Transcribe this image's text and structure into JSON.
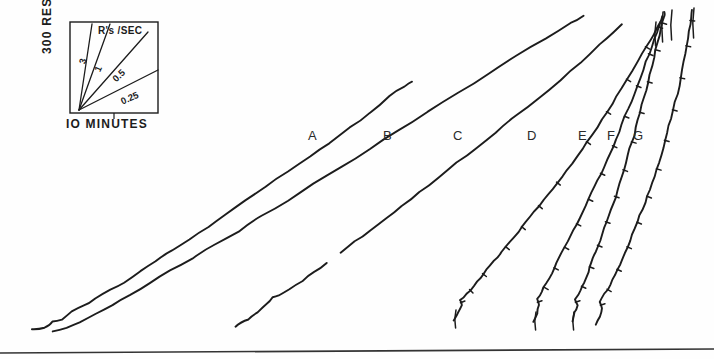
{
  "figure": {
    "background_color": "#fefefe",
    "ink_color": "#1c1c1c",
    "baseline_rule": {
      "name": "bottom-rule",
      "x1": 0,
      "y1": 353,
      "x2": 714,
      "y2": 349
    }
  },
  "legend": {
    "header": "R's /SEC",
    "y_axis_label": "300 RESPONSES",
    "x_axis_label": "IO MINUTES",
    "box": {
      "x": 70,
      "y": 22,
      "width": 88,
      "height": 91
    },
    "origin": {
      "x": 79,
      "y": 110
    },
    "tick_x": 114,
    "rate_lines": [
      {
        "label": "3",
        "end_x": 92,
        "end_y": 24,
        "label_x": 86,
        "label_y": 62,
        "angle": -76
      },
      {
        "label": "1",
        "end_x": 110,
        "end_y": 24,
        "label_x": 101,
        "label_y": 70,
        "angle": -66
      },
      {
        "label": "0.5",
        "end_x": 148,
        "end_y": 32,
        "label_x": 121,
        "label_y": 78,
        "angle": -44
      },
      {
        "label": "0.25",
        "end_x": 158,
        "end_y": 70,
        "label_x": 131,
        "label_y": 101,
        "angle": -24
      }
    ]
  },
  "chart_data": {
    "type": "line",
    "title": "",
    "subtitle": "",
    "xlabel": "IO MINUTES",
    "ylabel": "300 RESPONSES",
    "grid": false,
    "legend_position": "inset-top-left",
    "legend_entries": [
      "3",
      "1",
      "0.5",
      "0.25"
    ],
    "annotations": [
      "R's /SEC"
    ],
    "axis_note": "Cumulative response record; axes are calibration bars only, no numeric tick labels on the main field.",
    "series": [
      {
        "name": "A",
        "label_x": 308,
        "label_y": 128,
        "rate_rps": 0.25,
        "ticks": false,
        "points": [
          [
            32,
            329
          ],
          [
            45,
            328
          ],
          [
            52,
            322
          ],
          [
            62,
            319
          ],
          [
            72,
            311
          ],
          [
            84,
            306
          ],
          [
            96,
            299
          ],
          [
            110,
            290
          ],
          [
            124,
            282
          ],
          [
            140,
            271
          ],
          [
            156,
            261
          ],
          [
            172,
            251
          ],
          [
            190,
            239
          ],
          [
            208,
            227
          ],
          [
            226,
            215
          ],
          [
            246,
            201
          ],
          [
            266,
            187
          ],
          [
            288,
            172
          ],
          [
            310,
            157
          ],
          [
            330,
            143
          ],
          [
            350,
            128
          ],
          [
            370,
            113
          ],
          [
            390,
            96
          ],
          [
            404,
            86
          ],
          [
            412,
            82
          ]
        ]
      },
      {
        "name": "B",
        "label_x": 383,
        "label_y": 128,
        "rate_rps": 0.3,
        "ticks": false,
        "points": [
          [
            52,
            332
          ],
          [
            66,
            328
          ],
          [
            80,
            322
          ],
          [
            96,
            314
          ],
          [
            112,
            305
          ],
          [
            130,
            295
          ],
          [
            150,
            283
          ],
          [
            170,
            271
          ],
          [
            192,
            258
          ],
          [
            214,
            245
          ],
          [
            238,
            231
          ],
          [
            262,
            216
          ],
          [
            288,
            200
          ],
          [
            314,
            184
          ],
          [
            342,
            167
          ],
          [
            370,
            149
          ],
          [
            398,
            131
          ],
          [
            428,
            112
          ],
          [
            458,
            93
          ],
          [
            488,
            74
          ],
          [
            516,
            56
          ],
          [
            546,
            38
          ],
          [
            570,
            23
          ],
          [
            584,
            16
          ]
        ]
      },
      {
        "name": "C",
        "label_x": 453,
        "label_y": 128,
        "rate_rps": 0.4,
        "ticks": false,
        "break_at_index": 9,
        "points": [
          [
            235,
            326
          ],
          [
            248,
            319
          ],
          [
            258,
            312
          ],
          [
            266,
            304
          ],
          [
            272,
            298
          ],
          [
            278,
            295
          ],
          [
            290,
            289
          ],
          [
            302,
            281
          ],
          [
            314,
            272
          ],
          [
            326,
            263
          ],
          [
            340,
            253
          ],
          [
            354,
            242
          ],
          [
            370,
            230
          ],
          [
            386,
            218
          ],
          [
            402,
            206
          ],
          [
            420,
            192
          ],
          [
            438,
            178
          ],
          [
            456,
            163
          ],
          [
            476,
            148
          ],
          [
            496,
            132
          ],
          [
            516,
            116
          ],
          [
            538,
            98
          ],
          [
            560,
            80
          ],
          [
            580,
            63
          ],
          [
            600,
            45
          ],
          [
            614,
            32
          ],
          [
            622,
            24
          ]
        ]
      },
      {
        "name": "D",
        "label_x": 527,
        "label_y": 128,
        "rate_rps": 0.55,
        "ticks": true,
        "tick_count": 11,
        "points": [
          [
            454,
            320
          ],
          [
            459,
            312
          ],
          [
            462,
            305
          ],
          [
            460,
            300
          ],
          [
            466,
            294
          ],
          [
            474,
            286
          ],
          [
            480,
            278
          ],
          [
            486,
            270
          ],
          [
            494,
            261
          ],
          [
            502,
            252
          ],
          [
            510,
            242
          ],
          [
            518,
            232
          ],
          [
            526,
            222
          ],
          [
            534,
            212
          ],
          [
            544,
            200
          ],
          [
            552,
            189
          ],
          [
            562,
            176
          ],
          [
            572,
            163
          ],
          [
            582,
            149
          ],
          [
            592,
            135
          ],
          [
            602,
            120
          ],
          [
            612,
            104
          ],
          [
            622,
            88
          ],
          [
            632,
            71
          ],
          [
            642,
            54
          ],
          [
            650,
            40
          ],
          [
            656,
            29
          ],
          [
            660,
            22
          ]
        ]
      },
      {
        "name": "E",
        "label_x": 578,
        "label_y": 128,
        "rate_rps": 0.85,
        "ticks": true,
        "tick_count": 12,
        "points": [
          [
            534,
            322
          ],
          [
            537,
            313
          ],
          [
            539,
            305
          ],
          [
            537,
            299
          ],
          [
            542,
            292
          ],
          [
            547,
            283
          ],
          [
            552,
            273
          ],
          [
            557,
            263
          ],
          [
            562,
            253
          ],
          [
            568,
            242
          ],
          [
            574,
            230
          ],
          [
            580,
            218
          ],
          [
            586,
            206
          ],
          [
            592,
            193
          ],
          [
            598,
            180
          ],
          [
            604,
            167
          ],
          [
            610,
            153
          ],
          [
            616,
            139
          ],
          [
            622,
            124
          ],
          [
            628,
            109
          ],
          [
            634,
            94
          ],
          [
            640,
            78
          ],
          [
            646,
            62
          ],
          [
            652,
            46
          ],
          [
            657,
            32
          ],
          [
            660,
            22
          ],
          [
            662,
            16
          ]
        ]
      },
      {
        "name": "F",
        "label_x": 607,
        "label_y": 128,
        "rate_rps": 1.0,
        "ticks": true,
        "tick_count": 12,
        "points": [
          [
            572,
            322
          ],
          [
            575,
            313
          ],
          [
            577,
            305
          ],
          [
            575,
            299
          ],
          [
            580,
            291
          ],
          [
            584,
            282
          ],
          [
            588,
            272
          ],
          [
            592,
            262
          ],
          [
            596,
            251
          ],
          [
            600,
            240
          ],
          [
            604,
            228
          ],
          [
            608,
            216
          ],
          [
            613,
            203
          ],
          [
            617,
            190
          ],
          [
            621,
            177
          ],
          [
            626,
            163
          ],
          [
            630,
            149
          ],
          [
            634,
            135
          ],
          [
            638,
            120
          ],
          [
            642,
            105
          ],
          [
            646,
            90
          ],
          [
            650,
            74
          ],
          [
            654,
            58
          ],
          [
            658,
            42
          ],
          [
            661,
            28
          ],
          [
            664,
            18
          ],
          [
            665,
            12
          ]
        ]
      },
      {
        "name": "G",
        "label_x": 633,
        "label_y": 128,
        "rate_rps": 1.1,
        "ticks": true,
        "tick_count": 12,
        "points": [
          [
            596,
            324
          ],
          [
            600,
            316
          ],
          [
            602,
            308
          ],
          [
            600,
            302
          ],
          [
            605,
            294
          ],
          [
            610,
            285
          ],
          [
            615,
            275
          ],
          [
            620,
            264
          ],
          [
            625,
            253
          ],
          [
            630,
            241
          ],
          [
            635,
            229
          ],
          [
            640,
            216
          ],
          [
            645,
            203
          ],
          [
            650,
            190
          ],
          [
            655,
            176
          ],
          [
            659,
            162
          ],
          [
            663,
            148
          ],
          [
            667,
            133
          ],
          [
            671,
            118
          ],
          [
            675,
            102
          ],
          [
            679,
            86
          ],
          [
            682,
            70
          ],
          [
            685,
            54
          ],
          [
            688,
            38
          ],
          [
            690,
            25
          ],
          [
            691,
            16
          ],
          [
            692,
            10
          ]
        ]
      }
    ],
    "pen_resets": [
      {
        "series": "E",
        "x": 663,
        "y_top": 12,
        "y_bottom": 42
      },
      {
        "series": "F",
        "x": 672,
        "y_top": 10,
        "y_bottom": 40
      },
      {
        "series": "G",
        "x": 694,
        "y_top": 8,
        "y_bottom": 38
      },
      {
        "series": "D",
        "x": 656,
        "y_top": 22,
        "y_bottom": 46
      }
    ],
    "start_resets": [
      {
        "series": "D",
        "x": 456,
        "y_top": 310,
        "y_bottom": 328
      },
      {
        "series": "E",
        "x": 536,
        "y_top": 312,
        "y_bottom": 330
      },
      {
        "series": "F",
        "x": 574,
        "y_top": 312,
        "y_bottom": 330
      }
    ]
  }
}
